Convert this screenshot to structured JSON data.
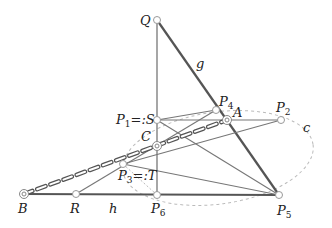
{
  "diagram": {
    "type": "geometric-construction",
    "colors": {
      "thick_line": "#555555",
      "thin_line": "#777777",
      "conic": "#bbbbbb",
      "dashed_line": "#555555",
      "point_fill": "#ffffff",
      "point_stroke": "#999999"
    },
    "points": {
      "Q": {
        "label": "Q",
        "x": 157,
        "y": 20
      },
      "P1": {
        "label": "P",
        "sub": "1",
        "suffix": "=:S",
        "x": 157,
        "y": 120
      },
      "P4": {
        "label": "P",
        "sub": "4",
        "x": 216,
        "y": 110
      },
      "A": {
        "label": "A",
        "x": 227,
        "y": 120
      },
      "P2": {
        "label": "P",
        "sub": "2",
        "x": 281,
        "y": 120
      },
      "C": {
        "label": "C",
        "x": 157,
        "y": 146
      },
      "P3": {
        "label": "P",
        "sub": "3",
        "suffix": "=:T",
        "x": 123,
        "y": 164
      },
      "B": {
        "label": "B",
        "x": 24,
        "y": 194
      },
      "R": {
        "label": "R",
        "x": 76,
        "y": 194
      },
      "P6": {
        "label": "P",
        "sub": "6",
        "x": 157,
        "y": 195
      },
      "P5": {
        "label": "P",
        "sub": "5",
        "x": 279,
        "y": 195
      }
    },
    "labels": {
      "Q": "Q",
      "g": "g",
      "P1_main": "P",
      "P1_sub": "1",
      "P1_suffix": "=:S",
      "P4_main": "P",
      "P4_sub": "4",
      "A": "A",
      "P2_main": "P",
      "P2_sub": "2",
      "c": "c",
      "C": "C",
      "P3_main": "P",
      "P3_sub": "3",
      "P3_suffix": "=:T",
      "B": "B",
      "R": "R",
      "h": "h",
      "P6_main": "P",
      "P6_sub": "6",
      "P5_main": "P",
      "P5_sub": "5"
    },
    "conic": {
      "name": "c",
      "cx": 218,
      "cy": 158,
      "rx": 96,
      "ry": 46,
      "rotation": -8
    }
  }
}
